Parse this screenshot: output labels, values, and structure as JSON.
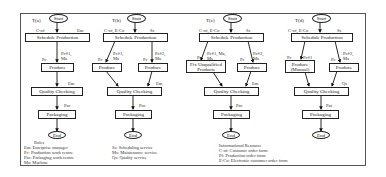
{
  "diagram": {
    "start_label": "Start",
    "end_label": "End",
    "panels": [
      {
        "id": "a",
        "title": "T(a)",
        "schedule": "Schedule Production",
        "schedule_in_left": "C-of",
        "schedule_in_right": "Em",
        "produce": [
          "Produce"
        ],
        "produce_labels": [
          {
            "left": "Pc",
            "right": "Pc#1, Ma"
          }
        ],
        "quality": "Quality Checking",
        "quality_label": "Em",
        "packaging": "Packaging",
        "packaging_label": "Pac"
      },
      {
        "id": "b",
        "title": "T(b)",
        "schedule": "Schedule Production",
        "schedule_in_left": "C-of, E-Co",
        "schedule_in_right": "Ss",
        "produce": [
          "Produce",
          "Produce"
        ],
        "produce_labels": [
          {
            "left": "Pc",
            "right": "Pc#1, Ma"
          },
          {
            "left": "Pc",
            "right": "Pc#2, Ma"
          }
        ],
        "quality": "Quality Checking",
        "quality_label": "Em",
        "packaging": "Packaging",
        "packaging_label": "Pac"
      },
      {
        "id": "c",
        "title": "T(c)",
        "schedule": "Schedule Production",
        "schedule_in_left": "C-of, E-Co",
        "schedule_in_right": "Ss",
        "produce": [
          "Fix Unqualified Products",
          "Produce"
        ],
        "produce_labels": [
          {
            "left": "Pc",
            "right": "Pc#1, Ma, Ms"
          },
          {
            "left": "Pc",
            "right": "Pc#2, Ma"
          }
        ],
        "quality": "Quality Checking",
        "quality_label": "Em",
        "packaging": "Packaging",
        "packaging_label": "Pac"
      },
      {
        "id": "d",
        "title": "T(d)",
        "schedule": "Schedule Production",
        "schedule_in_left": "C-of, E-Co",
        "schedule_in_right": "Ss",
        "produce": [
          "Produce (Manual)",
          "Produce"
        ],
        "produce_labels": [
          {
            "left": "Pc",
            "right": "Pc#1"
          },
          {
            "left": "Pc",
            "right": "Pc#2, Ma"
          }
        ],
        "quality": "Quality Checking",
        "quality_label": "Qs",
        "packaging": "Packaging",
        "packaging_label": "Pac"
      }
    ],
    "roles": {
      "heading": "Roles",
      "left": [
        "Em: Enterprise manager",
        "Pc: Production work centre",
        "Pac: Packaging work centre",
        "Ma: Machine"
      ],
      "right": [
        "Ss: Scheduling service",
        "Ms: Maintenance service",
        "Qs: Quality service"
      ]
    },
    "resources": {
      "heading": "Informational Resource",
      "items": [
        "C-of: Customer order form",
        "Pf: Production order form",
        "E-Co: Electronic customer order form"
      ]
    }
  }
}
